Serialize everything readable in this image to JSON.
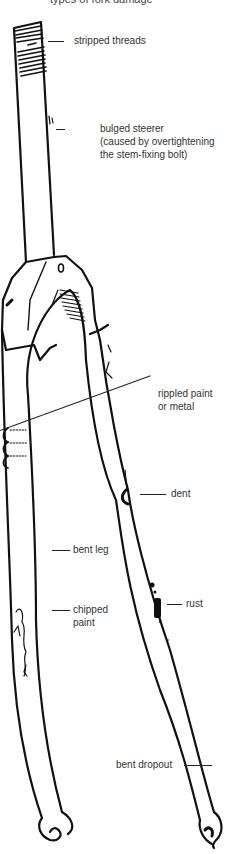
{
  "title_partial": "types of fork damage",
  "diagram": {
    "line_color": "#111111",
    "text_color": "#333333",
    "background": "#ffffff"
  },
  "labels": {
    "stripped_threads": "stripped threads",
    "bulged_steerer_line1": "bulged steerer",
    "bulged_steerer_line2": "(caused by overtightening",
    "bulged_steerer_line3": "the stem-fixing bolt)",
    "rippled_line1": "rippled paint",
    "rippled_line2": "or metal",
    "dent": "dent",
    "bent_leg": "bent leg",
    "chipped_line1": "chipped",
    "chipped_line2": "paint",
    "rust": "rust",
    "bent_dropout": "bent dropout"
  }
}
